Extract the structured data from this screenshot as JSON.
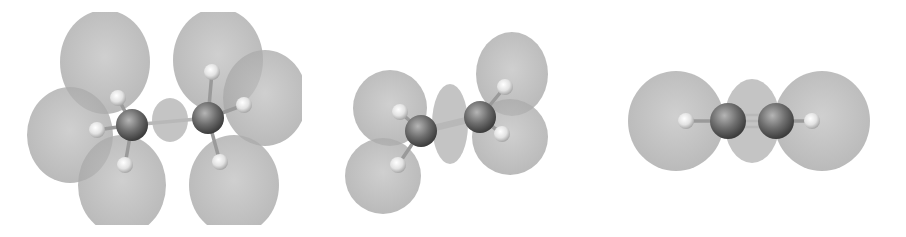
{
  "figure": {
    "colors": {
      "background": "#ffffff",
      "lobe_fill": "#a9a9a9",
      "lobe_overlap": "#8c8c8c",
      "carbon": "#6e6e6e",
      "hydrogen": "#e6e6e6",
      "bond": "#c8c8c8"
    },
    "molecules": [
      {
        "id": "ethane",
        "label": "",
        "bond_order": 1,
        "carbons": [
          [
            132,
            125
          ],
          [
            208,
            118
          ]
        ],
        "hydrogens": [
          [
            118,
            98
          ],
          [
            97,
            130
          ],
          [
            125,
            165
          ],
          [
            212,
            72
          ],
          [
            244,
            105
          ],
          [
            220,
            162
          ]
        ],
        "center_lobe": {
          "cx": 170,
          "cy": 120,
          "rx": 18,
          "ry": 22
        },
        "lobes": [
          {
            "cx": 105,
            "cy": 62,
            "rx": 45,
            "ry": 52
          },
          {
            "cx": 218,
            "cy": 60,
            "rx": 45,
            "ry": 52
          },
          {
            "cx": 70,
            "cy": 135,
            "rx": 43,
            "ry": 48
          },
          {
            "cx": 265,
            "cy": 98,
            "rx": 42,
            "ry": 48
          },
          {
            "cx": 122,
            "cy": 185,
            "rx": 44,
            "ry": 50
          },
          {
            "cx": 234,
            "cy": 185,
            "rx": 45,
            "ry": 50
          }
        ]
      },
      {
        "id": "ethylene",
        "label": "",
        "bond_order": 2,
        "carbons": [
          [
            421,
            131
          ],
          [
            480,
            117
          ]
        ],
        "hydrogens": [
          [
            400,
            112
          ],
          [
            398,
            165
          ],
          [
            505,
            87
          ],
          [
            502,
            134
          ]
        ],
        "center_lobe": {
          "cx": 450,
          "cy": 124,
          "rx": 18,
          "ry": 40
        },
        "lobes": [
          {
            "cx": 390,
            "cy": 108,
            "rx": 37,
            "ry": 38
          },
          {
            "cx": 383,
            "cy": 176,
            "rx": 38,
            "ry": 38
          },
          {
            "cx": 512,
            "cy": 74,
            "rx": 36,
            "ry": 42
          },
          {
            "cx": 510,
            "cy": 137,
            "rx": 38,
            "ry": 38
          }
        ]
      },
      {
        "id": "acetylene",
        "label": "",
        "bond_order": 3,
        "carbons": [
          [
            728,
            121
          ],
          [
            776,
            121
          ]
        ],
        "hydrogens": [
          [
            686,
            121
          ],
          [
            812,
            121
          ]
        ],
        "center_lobe": {
          "cx": 752,
          "cy": 121,
          "rx": 28,
          "ry": 42
        },
        "lobes": [
          {
            "cx": 676,
            "cy": 121,
            "rx": 48,
            "ry": 50
          },
          {
            "cx": 822,
            "cy": 121,
            "rx": 48,
            "ry": 50
          }
        ]
      }
    ]
  }
}
